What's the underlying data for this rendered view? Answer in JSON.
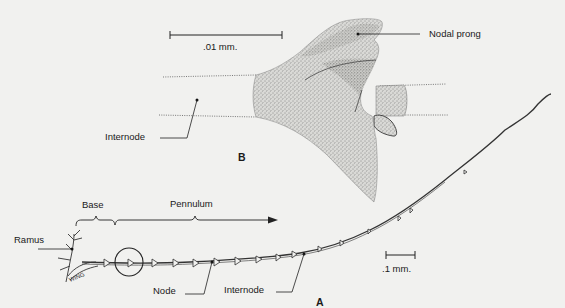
{
  "figure": {
    "panel_b": {
      "panel_label": "B",
      "scale_bar": {
        "label": ".01 mm."
      },
      "labels": {
        "nodal_prong": "Nodal prong",
        "internode": "Internode"
      }
    },
    "panel_a": {
      "panel_label": "A",
      "scale_bar": {
        "label": ".1 mm."
      },
      "labels": {
        "base": "Base",
        "pennulum": "Pennulum",
        "ramus": "Ramus",
        "node": "Node",
        "internode": "Internode",
        "wing": "WING"
      }
    }
  }
}
